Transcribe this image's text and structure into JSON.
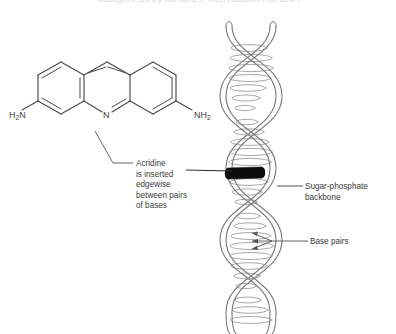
{
  "figure": {
    "title": "Mutagenesis by acridines: intercalation into DNA",
    "background_color": "#ffffff",
    "width": 396,
    "height": 334
  },
  "molecule": {
    "name": "acridine",
    "common_name": "proflavine",
    "ring_system": "acridine-tricyclic",
    "atoms": {
      "amine_left": "H",
      "amine_left_sub": "2",
      "amine_left_tail": "N",
      "amine_right": "NH",
      "amine_right_sub": "2",
      "ring_nitrogen": "N"
    }
  },
  "helix": {
    "name": "dna-double-helix",
    "strand_color": "#8a8a8a",
    "rung_color": "#9a9a9a",
    "intercalator_color": "#0d0d0d",
    "turns": 4
  },
  "annotations": {
    "acridine": {
      "lines": [
        "Acridine",
        "is inserted",
        "edgewise",
        "between pairs",
        "of bases"
      ]
    },
    "sugar_phosphate": {
      "lines": [
        "Sugar-phosphate",
        "backbone"
      ]
    },
    "base_pairs": {
      "lines": [
        "Base pairs"
      ]
    }
  },
  "colors": {
    "text": "#3a3a3a",
    "line": "#555555",
    "molecule_stroke": "#4a4a4a",
    "helix_stroke": "#8a8a8a",
    "intercalator": "#0d0d0d"
  }
}
